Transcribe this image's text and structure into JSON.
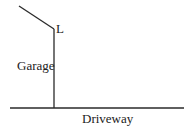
{
  "diagram": {
    "labels": {
      "point": "L",
      "vertical_line": "Garage",
      "horizontal_line": "Driveway"
    },
    "colors": {
      "stroke": "#2a2a2a",
      "text": "#222222",
      "background": "#ffffff"
    },
    "segments": {
      "diagonal": {
        "x1": 19,
        "y1": 6,
        "x2": 54,
        "y2": 29
      },
      "vertical": {
        "x1": 54,
        "y1": 29,
        "x2": 54,
        "y2": 108
      },
      "horizontal": {
        "x1": 10,
        "y1": 108,
        "x2": 184,
        "y2": 108
      }
    }
  }
}
